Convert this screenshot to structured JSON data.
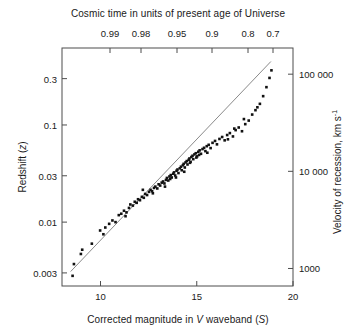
{
  "chart_data": {
    "type": "scatter",
    "title": "",
    "xlabel": "Corrected magnitude in V waveband (S)",
    "ylabel": "Redshift (z)",
    "top_axis": {
      "label": "Cosmic time in units of present age of Universe",
      "ticks": [
        "0.99",
        "0.98",
        "0.95",
        "0.9",
        "0.8",
        "0.7"
      ],
      "tick_positions": [
        110,
        141,
        177,
        212,
        248,
        273
      ]
    },
    "right_axis": {
      "label": "Velocity of recession, km s",
      "label_exponent": "-1",
      "ticks": [
        "100 000",
        "10 000",
        "1000"
      ],
      "tick_values": [
        100000,
        10000,
        1000
      ],
      "scale": "log"
    },
    "xlim": [
      8,
      20
    ],
    "xticks": [
      10,
      15,
      20
    ],
    "xtick_labels": [
      "10",
      "15",
      "20"
    ],
    "ylim": [
      0.0022,
      0.62
    ],
    "yticks": [
      0.3,
      0.1,
      0.03,
      0.01,
      0.003
    ],
    "ytick_labels": [
      "0.3",
      "0.1",
      "0.03",
      "0.01",
      "0.003"
    ],
    "yscale": "log",
    "grid": false,
    "legend": null,
    "marker": {
      "shape": "square",
      "color": "#111111",
      "size": 2.6
    },
    "fit_line": {
      "color": "#6b6b6b",
      "width": 0.8,
      "x_start": 8.45,
      "y_start": 0.0031,
      "x_end": 18.85,
      "y_end": 0.45
    },
    "points": [
      [
        8.55,
        0.0028
      ],
      [
        8.62,
        0.0037
      ],
      [
        8.98,
        0.0047
      ],
      [
        9.05,
        0.0052
      ],
      [
        9.55,
        0.006
      ],
      [
        9.98,
        0.0082
      ],
      [
        10.25,
        0.0088
      ],
      [
        10.45,
        0.0096
      ],
      [
        10.62,
        0.0104
      ],
      [
        10.78,
        0.01
      ],
      [
        10.95,
        0.0118
      ],
      [
        11.08,
        0.0122
      ],
      [
        11.22,
        0.0131
      ],
      [
        11.35,
        0.0126
      ],
      [
        11.48,
        0.014
      ],
      [
        11.55,
        0.0152
      ],
      [
        11.68,
        0.0148
      ],
      [
        11.78,
        0.0162
      ],
      [
        11.88,
        0.0158
      ],
      [
        11.95,
        0.0172
      ],
      [
        12.05,
        0.0168
      ],
      [
        12.15,
        0.0182
      ],
      [
        12.25,
        0.0178
      ],
      [
        12.32,
        0.0195
      ],
      [
        12.42,
        0.019
      ],
      [
        12.52,
        0.0205
      ],
      [
        12.6,
        0.0215
      ],
      [
        12.68,
        0.0208
      ],
      [
        12.78,
        0.0225
      ],
      [
        12.85,
        0.0232
      ],
      [
        12.95,
        0.0222
      ],
      [
        13.02,
        0.0245
      ],
      [
        13.1,
        0.0238
      ],
      [
        13.18,
        0.0255
      ],
      [
        13.25,
        0.0262
      ],
      [
        13.32,
        0.025
      ],
      [
        13.4,
        0.0272
      ],
      [
        13.45,
        0.0285
      ],
      [
        13.52,
        0.0268
      ],
      [
        13.58,
        0.0295
      ],
      [
        13.65,
        0.0305
      ],
      [
        13.7,
        0.0288
      ],
      [
        13.78,
        0.0315
      ],
      [
        13.82,
        0.0325
      ],
      [
        13.88,
        0.0302
      ],
      [
        13.95,
        0.0338
      ],
      [
        14.0,
        0.0348
      ],
      [
        14.05,
        0.032
      ],
      [
        14.12,
        0.0358
      ],
      [
        14.18,
        0.0372
      ],
      [
        14.22,
        0.0342
      ],
      [
        14.28,
        0.0385
      ],
      [
        14.32,
        0.0398
      ],
      [
        14.38,
        0.0365
      ],
      [
        14.42,
        0.0412
      ],
      [
        14.48,
        0.0425
      ],
      [
        14.52,
        0.0392
      ],
      [
        14.58,
        0.0438
      ],
      [
        14.62,
        0.0452
      ],
      [
        14.68,
        0.0418
      ],
      [
        14.72,
        0.0468
      ],
      [
        14.78,
        0.0482
      ],
      [
        14.82,
        0.0445
      ],
      [
        14.88,
        0.0498
      ],
      [
        14.95,
        0.0512
      ],
      [
        15.02,
        0.0475
      ],
      [
        15.08,
        0.053
      ],
      [
        15.15,
        0.0548
      ],
      [
        15.22,
        0.0505
      ],
      [
        15.3,
        0.0565
      ],
      [
        15.38,
        0.0582
      ],
      [
        15.45,
        0.0538
      ],
      [
        15.52,
        0.0605
      ],
      [
        15.62,
        0.0625
      ],
      [
        15.72,
        0.0578
      ],
      [
        15.82,
        0.0655
      ],
      [
        15.95,
        0.0685
      ],
      [
        16.05,
        0.0632
      ],
      [
        16.18,
        0.0718
      ],
      [
        16.32,
        0.0752
      ],
      [
        16.45,
        0.0695
      ],
      [
        16.58,
        0.0788
      ],
      [
        16.72,
        0.0825
      ],
      [
        16.88,
        0.0762
      ],
      [
        17.02,
        0.0885
      ],
      [
        17.18,
        0.0942
      ],
      [
        17.35,
        0.0862
      ],
      [
        17.52,
        0.102
      ],
      [
        17.7,
        0.111
      ],
      [
        17.88,
        0.128
      ],
      [
        18.05,
        0.142
      ],
      [
        18.28,
        0.165
      ],
      [
        18.45,
        0.198
      ],
      [
        18.62,
        0.245
      ],
      [
        18.78,
        0.305
      ],
      [
        18.88,
        0.365
      ],
      [
        12.2,
        0.0215
      ],
      [
        13.35,
        0.0232
      ],
      [
        14.35,
        0.033
      ],
      [
        15.55,
        0.0518
      ],
      [
        16.62,
        0.0712
      ],
      [
        17.45,
        0.115
      ],
      [
        11.3,
        0.0115
      ],
      [
        10.15,
        0.0075
      ],
      [
        13.62,
        0.0278
      ],
      [
        14.65,
        0.0408
      ],
      [
        15.12,
        0.0492
      ],
      [
        16.95,
        0.0918
      ],
      [
        18.15,
        0.152
      ],
      [
        12.72,
        0.0198
      ],
      [
        13.92,
        0.0288
      ],
      [
        14.98,
        0.0462
      ]
    ]
  },
  "axes": {
    "bottom_label": "Corrected magnitude in V waveband (S)",
    "bottom_label_prefix": "Corrected magnitude in ",
    "bottom_label_italic_v": "V",
    "bottom_label_mid": " waveband (",
    "bottom_label_italic_s": "S",
    "bottom_label_suffix": ")",
    "left_label_prefix": "Redshift (",
    "left_label_italic": "z",
    "left_label_suffix": ")",
    "top_label": "Cosmic time in units of present age of Universe",
    "right_label": "Velocity of recession, km s"
  }
}
